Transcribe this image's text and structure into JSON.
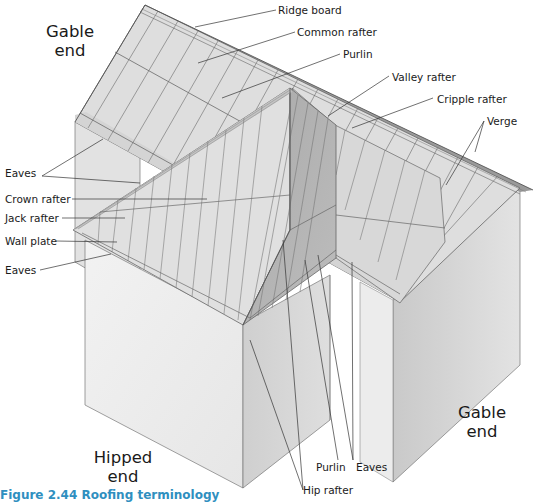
{
  "figure": {
    "caption": "Figure 2.44 Roofing terminology",
    "colors": {
      "caption": "#2f8fbf",
      "roof_light": "#dcdcdc",
      "roof_dark": "#b4b4b4",
      "wall_light": "#ececec",
      "wall_mid": "#d2d2d2",
      "line": "#555555",
      "leader": "#333333"
    }
  },
  "regions": {
    "gable_end_top": {
      "line1": "Gable",
      "line2": "end"
    },
    "gable_end_right": {
      "line1": "Gable",
      "line2": "end"
    },
    "hipped_end": {
      "line1": "Hipped",
      "line2": "end"
    }
  },
  "labels": {
    "ridge_board": "Ridge board",
    "common_rafter": "Common rafter",
    "purlin_top": "Purlin",
    "valley_rafter": "Valley rafter",
    "cripple_rafter": "Cripple rafter",
    "verge": "Verge",
    "eaves_upper": "Eaves",
    "crown_rafter": "Crown rafter",
    "jack_rafter": "Jack rafter",
    "wall_plate": "Wall plate",
    "eaves_lower": "Eaves",
    "purlin_bottom": "Purlin",
    "eaves_bottom": "Eaves",
    "hip_rafter": "Hip rafter"
  }
}
